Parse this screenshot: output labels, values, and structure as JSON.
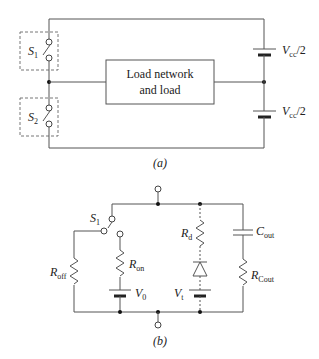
{
  "figure_a": {
    "caption": "(a)",
    "switch1": {
      "main": "S",
      "sub": "1"
    },
    "switch2": {
      "main": "S",
      "sub": "2"
    },
    "load_line1": "Load network",
    "load_line2": "and load",
    "supply_top": {
      "main": "V",
      "sub": "cc",
      "suffix": "/2"
    },
    "supply_bottom": {
      "main": "V",
      "sub": "cc",
      "suffix": "/2"
    }
  },
  "figure_b": {
    "caption": "(b)",
    "switch": {
      "main": "S",
      "sub": "1"
    },
    "r_off": {
      "main": "R",
      "sub": "off"
    },
    "r_on": {
      "main": "R",
      "sub": "on"
    },
    "v0": {
      "main": "V",
      "sub": "0"
    },
    "r_d": {
      "main": "R",
      "sub": "d"
    },
    "v_t": {
      "main": "V",
      "sub": "t"
    },
    "c_out": {
      "main": "C",
      "sub": "out"
    },
    "r_cout": {
      "main": "R",
      "sub": "Cout"
    }
  },
  "colors": {
    "wire": "#555555",
    "background": "#ffffff"
  }
}
